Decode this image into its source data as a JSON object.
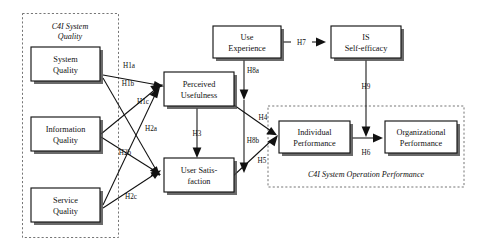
{
  "diagram": {
    "type": "path-model",
    "groups": [
      {
        "id": "g-quality",
        "label": "C4I System Quality",
        "label_lines": [
          "C4I System",
          "Quality"
        ],
        "label_style": "italic",
        "label_position": "top",
        "border": "dashed"
      },
      {
        "id": "g-performance",
        "label": "C4I System Operation Performance",
        "label_lines": [
          "C4I System Operation Performance"
        ],
        "label_style": "italic",
        "label_position": "bottom",
        "border": "dashed"
      }
    ],
    "nodes": [
      {
        "id": "system-quality",
        "lines": [
          "System",
          "Quality"
        ],
        "group": "g-quality"
      },
      {
        "id": "information-quality",
        "lines": [
          "Information",
          "Quality"
        ],
        "group": "g-quality"
      },
      {
        "id": "service-quality",
        "lines": [
          "Service",
          "Quality"
        ],
        "group": "g-quality"
      },
      {
        "id": "perceived-usefulness",
        "lines": [
          "Perceived",
          "Usefulness"
        ],
        "group": null
      },
      {
        "id": "user-satisfaction",
        "lines": [
          "User Satis-",
          "faction"
        ],
        "group": null
      },
      {
        "id": "use-experience",
        "lines": [
          "Use",
          "Experience"
        ],
        "group": null
      },
      {
        "id": "is-self-efficacy",
        "lines": [
          "IS",
          "Self-efficacy"
        ],
        "group": null
      },
      {
        "id": "individual-performance",
        "lines": [
          "Individual",
          "Performance"
        ],
        "group": "g-performance"
      },
      {
        "id": "organizational-performance",
        "lines": [
          "Organizational",
          "Performance"
        ],
        "group": "g-performance"
      }
    ],
    "edges": [
      {
        "id": "h1a",
        "label": "H1a",
        "from": "system-quality",
        "to": "perceived-usefulness"
      },
      {
        "id": "h1b",
        "label": "H1b",
        "from": "information-quality",
        "to": "perceived-usefulness"
      },
      {
        "id": "h1c",
        "label": "H1c",
        "from": "service-quality",
        "to": "perceived-usefulness"
      },
      {
        "id": "h2a",
        "label": "H2a",
        "from": "system-quality",
        "to": "user-satisfaction"
      },
      {
        "id": "h2b",
        "label": "H2b",
        "from": "information-quality",
        "to": "user-satisfaction"
      },
      {
        "id": "h2c",
        "label": "H2c",
        "from": "service-quality",
        "to": "user-satisfaction"
      },
      {
        "id": "h3",
        "label": "H3",
        "from": "perceived-usefulness",
        "to": "user-satisfaction"
      },
      {
        "id": "h4",
        "label": "H4",
        "from": "perceived-usefulness",
        "to": "individual-performance"
      },
      {
        "id": "h5",
        "label": "H5",
        "from": "user-satisfaction",
        "to": "individual-performance"
      },
      {
        "id": "h6",
        "label": "H6",
        "from": "individual-performance",
        "to": "organizational-performance"
      },
      {
        "id": "h7",
        "label": "H7",
        "from": "use-experience",
        "to": "is-self-efficacy"
      },
      {
        "id": "h8a",
        "label": "H8a",
        "from": "use-experience",
        "to": "perceived-usefulness"
      },
      {
        "id": "h8b",
        "label": "H8b",
        "from": "use-experience",
        "to": "user-satisfaction"
      },
      {
        "id": "h9",
        "label": "H9",
        "from": "is-self-efficacy",
        "to": "h6"
      }
    ],
    "colors": {
      "box_fill": "#ffffff",
      "box_stroke": "#161616",
      "shadow": "#4a4a4a",
      "group_border": "#5d5d5d",
      "edge": "#111111",
      "text": "#111111"
    }
  }
}
